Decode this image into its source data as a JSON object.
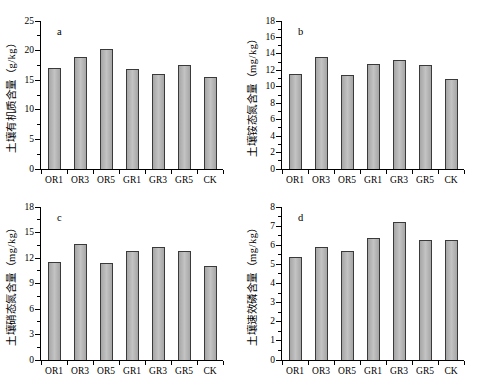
{
  "figure": {
    "background": "#ffffff"
  },
  "colors": {
    "bar_fill_edge": "#a6a6a6",
    "bar_fill_center": "#c3c3c3",
    "bar_border": "#3a3a3a",
    "axis": "#000000",
    "text": "#000000"
  },
  "chart_data": [
    {
      "id": "a",
      "panel_label": "a",
      "type": "bar",
      "ylabel": "土壤有机质含量（g/kg）",
      "categories": [
        "OR1",
        "OR3",
        "OR5",
        "GR1",
        "GR3",
        "GR5",
        "CK"
      ],
      "values": [
        17.1,
        19.0,
        20.3,
        16.9,
        16.1,
        17.6,
        15.5
      ],
      "ylim": [
        0,
        25
      ],
      "yticks": [
        0,
        5,
        10,
        15,
        20,
        25
      ],
      "minor_tick_step": 2.5,
      "grid": false,
      "legend": null
    },
    {
      "id": "b",
      "panel_label": "b",
      "type": "bar",
      "ylabel": "土壤铵态氮含量（mg/kg）",
      "categories": [
        "OR1",
        "OR3",
        "OR5",
        "GR1",
        "GR3",
        "GR5",
        "CK"
      ],
      "values": [
        11.5,
        13.6,
        11.4,
        12.8,
        13.2,
        12.7,
        11.0
      ],
      "ylim": [
        0,
        18
      ],
      "yticks": [
        0,
        2,
        4,
        6,
        8,
        10,
        12,
        14,
        16,
        18
      ],
      "minor_tick_step": 1,
      "grid": false,
      "legend": null
    },
    {
      "id": "c",
      "panel_label": "c",
      "type": "bar",
      "ylabel": "土壤硝态氮含量（mg/kg）",
      "categories": [
        "OR1",
        "OR3",
        "OR5",
        "GR1",
        "GR3",
        "GR5",
        "CK"
      ],
      "values": [
        11.5,
        13.6,
        11.4,
        12.8,
        13.3,
        12.8,
        11.1
      ],
      "ylim": [
        0,
        18
      ],
      "yticks": [
        0,
        3,
        6,
        9,
        12,
        15,
        18
      ],
      "minor_tick_step": 1.5,
      "grid": false,
      "legend": null
    },
    {
      "id": "d",
      "panel_label": "d",
      "type": "bar",
      "ylabel": "土壤速效磷含量（mg/kg）",
      "categories": [
        "OR1",
        "OR3",
        "OR5",
        "GR1",
        "GR3",
        "GR5",
        "CK"
      ],
      "values": [
        5.4,
        5.9,
        5.7,
        6.4,
        7.2,
        6.3,
        6.3
      ],
      "ylim": [
        0,
        8
      ],
      "yticks": [
        0,
        1,
        2,
        3,
        4,
        5,
        6,
        7,
        8
      ],
      "minor_tick_step": 0.5,
      "grid": false,
      "legend": null
    }
  ]
}
